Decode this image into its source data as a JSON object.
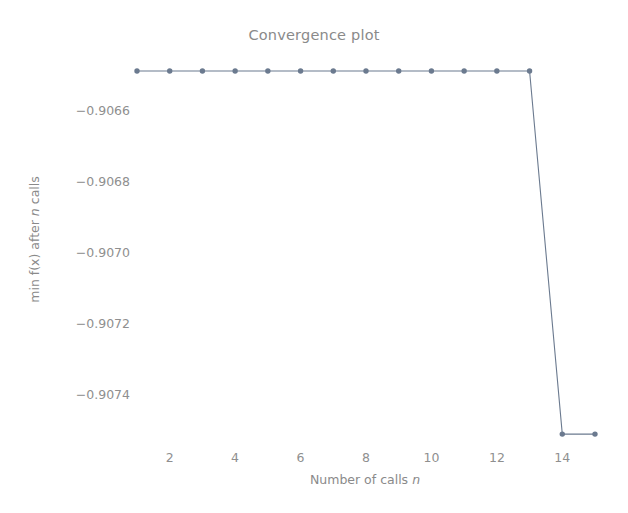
{
  "chart_data": {
    "type": "line",
    "title": "Convergence plot",
    "xlabel": "Number of calls n",
    "xlabel_plain": "Number of calls ",
    "xlabel_var": "n",
    "ylabel": "min f(x) after n calls",
    "ylabel_prefix": "min f(x) after ",
    "ylabel_var": "n",
    "ylabel_suffix": " calls",
    "x": [
      1,
      2,
      3,
      4,
      5,
      6,
      7,
      8,
      9,
      10,
      11,
      12,
      13,
      14,
      15
    ],
    "values": [
      -0.90649,
      -0.90649,
      -0.90649,
      -0.90649,
      -0.90649,
      -0.90649,
      -0.90649,
      -0.90649,
      -0.90649,
      -0.90649,
      -0.90649,
      -0.90649,
      -0.90649,
      -0.907513,
      -0.907513
    ],
    "series": [
      {
        "name": "min f(x) after n calls",
        "values": [
          -0.90649,
          -0.90649,
          -0.90649,
          -0.90649,
          -0.90649,
          -0.90649,
          -0.90649,
          -0.90649,
          -0.90649,
          -0.90649,
          -0.90649,
          -0.90649,
          -0.90649,
          -0.907513,
          -0.907513
        ]
      }
    ],
    "xlim": [
      0.3,
      15.7
    ],
    "ylim": [
      -0.9075985,
      -0.9064338
    ],
    "xticks": [
      2,
      4,
      6,
      8,
      10,
      12,
      14
    ],
    "xtick_labels": [
      "2",
      "4",
      "6",
      "8",
      "10",
      "12",
      "14"
    ],
    "yticks": [
      -0.9066,
      -0.9068,
      -0.907,
      -0.9072,
      -0.9074
    ],
    "ytick_labels": [
      "−0.9066",
      "−0.9068",
      "−0.9070",
      "−0.9072",
      "−0.9074"
    ],
    "grid": false,
    "legend": null,
    "marker": "circle",
    "line_color": "#6b7a8f",
    "marker_color": "#6b7a8f",
    "text_color": "#8a8a8a",
    "background_color": "#ffffff"
  }
}
